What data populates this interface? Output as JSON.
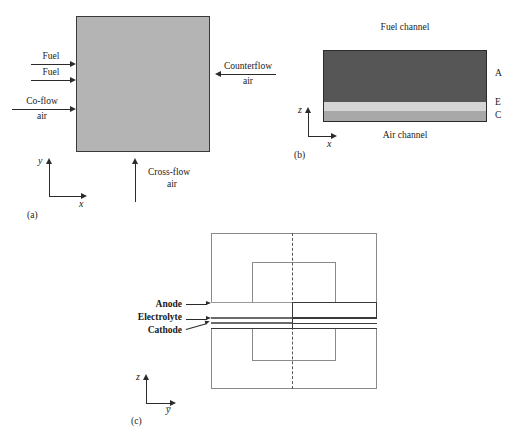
{
  "figure": {
    "panels": [
      {
        "id": "a",
        "caption": "(a)",
        "description": "Planar cell top view with flow direction arrows"
      },
      {
        "id": "b",
        "caption": "(b)",
        "description": "Cell cross-section along x showing anode, electrolyte, cathode"
      },
      {
        "id": "c",
        "caption": "(c)",
        "description": "Cell cross-section along y with labeled layers"
      }
    ]
  },
  "panel_a": {
    "caption": "(a)",
    "flows": [
      {
        "name": "fuel-top",
        "label": "Fuel",
        "label2": "",
        "direction": "right"
      },
      {
        "name": "fuel-bottom",
        "label": "Fuel",
        "label2": "",
        "direction": "right"
      },
      {
        "name": "co-flow",
        "label": "Co-flow",
        "label2": "air",
        "direction": "right"
      },
      {
        "name": "counterflow",
        "label": "Counterflow",
        "label2": "air",
        "direction": "left"
      },
      {
        "name": "cross-flow",
        "label": "Cross-flow",
        "label2": "air",
        "direction": "up"
      }
    ],
    "axes": {
      "vertical": "y",
      "horizontal": "x"
    },
    "fill_color": "#b4b4b4",
    "border_color": "#3a3a3a"
  },
  "panel_b": {
    "caption": "(b)",
    "top_channel": "Fuel channel",
    "bottom_channel": "Air channel",
    "layers": [
      {
        "key": "A",
        "name": "anode",
        "label": "A",
        "color": "#565656"
      },
      {
        "key": "E",
        "name": "electrolyte",
        "label": "E",
        "color": "#d5d5d5"
      },
      {
        "key": "C",
        "name": "cathode",
        "label": "C",
        "color": "#a8a8a8"
      }
    ],
    "axes": {
      "vertical": "z",
      "horizontal": "x"
    }
  },
  "panel_c": {
    "caption": "(c)",
    "layer_labels": [
      {
        "name": "anode",
        "label": "Anode"
      },
      {
        "name": "electrolyte",
        "label": "Electrolyte"
      },
      {
        "name": "cathode",
        "label": "Cathode"
      }
    ],
    "axes": {
      "vertical": "z",
      "horizontal": "y̅"
    }
  },
  "colors": {
    "panel_a_fill": "#b4b4b4",
    "anode": "#565656",
    "electrolyte": "#d5d5d5",
    "cathode": "#a8a8a8",
    "stroke": "#2b2b2b",
    "light_stroke": "#8a8a8a",
    "background": "#ffffff"
  }
}
